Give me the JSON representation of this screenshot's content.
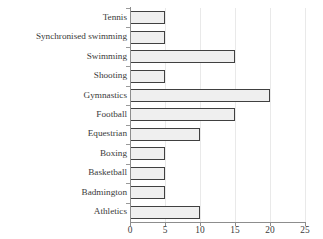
{
  "chart_data": {
    "type": "bar",
    "orientation": "horizontal",
    "title": "",
    "xlabel": "",
    "ylabel": "",
    "xlim": [
      0,
      25
    ],
    "xticks": [
      0,
      5,
      10,
      15,
      20,
      25
    ],
    "grid": true,
    "grid_axis": "x",
    "legend": false,
    "categories": [
      "Tennis",
      "Synchronised swimming",
      "Swimming",
      "Shooting",
      "Gymnastics",
      "Football",
      "Equestrian",
      "Boxing",
      "Basketball",
      "Badmington",
      "Athletics"
    ],
    "values": [
      5,
      5,
      15,
      5,
      20,
      15,
      10,
      5,
      5,
      5,
      10
    ],
    "colors": {
      "bar_fill": "#efefef",
      "bar_edge": "#404040",
      "axis": "#8d8d8d",
      "grid": "#e9e9e9",
      "text": "#3a3a3a",
      "background": "#ffffff"
    }
  }
}
